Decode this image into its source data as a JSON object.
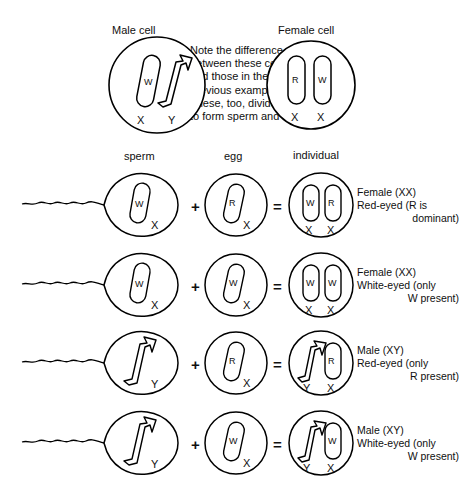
{
  "diagram": {
    "title_top_left": "Male cell",
    "title_top_right": "Female cell",
    "note": "Note the difference\nbetween these cells\nand those in the\nprevious example.\nThese, too, divide\nto form sperm and eggs.",
    "column_headers": {
      "sperm": "sperm",
      "egg": "egg",
      "individual": "individual"
    },
    "operators": {
      "plus": "+",
      "equals": "="
    },
    "colors": {
      "ink": "#000000",
      "paper": "#ffffff",
      "text": "#101010"
    }
  },
  "top_cells": {
    "male": {
      "name": "Male cell",
      "chromosomes": [
        {
          "shape": "rod",
          "gene": "W",
          "axis": "X"
        },
        {
          "shape": "hook",
          "gene": "",
          "axis": "Y"
        }
      ]
    },
    "female": {
      "name": "Female cell",
      "chromosomes": [
        {
          "shape": "rod",
          "gene": "R",
          "axis": "X"
        },
        {
          "shape": "rod",
          "gene": "W",
          "axis": "X"
        }
      ]
    }
  },
  "crosses": [
    {
      "sperm": {
        "shape": "rod",
        "gene": "W",
        "axis": "X"
      },
      "egg": {
        "shape": "rod",
        "gene": "R",
        "axis": "X"
      },
      "individual": {
        "chromosomes": [
          {
            "shape": "rod",
            "gene": "W",
            "axis": "X"
          },
          {
            "shape": "rod",
            "gene": "R",
            "axis": "X"
          }
        ]
      },
      "outcome": {
        "line1": "Female (XX)",
        "line2": "Red-eyed (R is",
        "line3": "dominant)"
      }
    },
    {
      "sperm": {
        "shape": "rod",
        "gene": "W",
        "axis": "X"
      },
      "egg": {
        "shape": "rod",
        "gene": "W",
        "axis": "X"
      },
      "individual": {
        "chromosomes": [
          {
            "shape": "rod",
            "gene": "W",
            "axis": "X"
          },
          {
            "shape": "rod",
            "gene": "W",
            "axis": "X"
          }
        ]
      },
      "outcome": {
        "line1": "Female (XX)",
        "line2": "White-eyed (only",
        "line3": "W present)"
      }
    },
    {
      "sperm": {
        "shape": "hook",
        "gene": "",
        "axis": "Y"
      },
      "egg": {
        "shape": "rod",
        "gene": "R",
        "axis": "X"
      },
      "individual": {
        "chromosomes": [
          {
            "shape": "hook",
            "gene": "",
            "axis": "Y"
          },
          {
            "shape": "rod",
            "gene": "R",
            "axis": "X"
          }
        ]
      },
      "outcome": {
        "line1": "Male (XY)",
        "line2": "Red-eyed (only",
        "line3": "R present)"
      }
    },
    {
      "sperm": {
        "shape": "hook",
        "gene": "",
        "axis": "Y"
      },
      "egg": {
        "shape": "rod",
        "gene": "W",
        "axis": "X"
      },
      "individual": {
        "chromosomes": [
          {
            "shape": "hook",
            "gene": "",
            "axis": "Y"
          },
          {
            "shape": "rod",
            "gene": "W",
            "axis": "X"
          }
        ]
      },
      "outcome": {
        "line1": "Male (XY)",
        "line2": "White-eyed (only",
        "line3": "W present)"
      }
    }
  ]
}
